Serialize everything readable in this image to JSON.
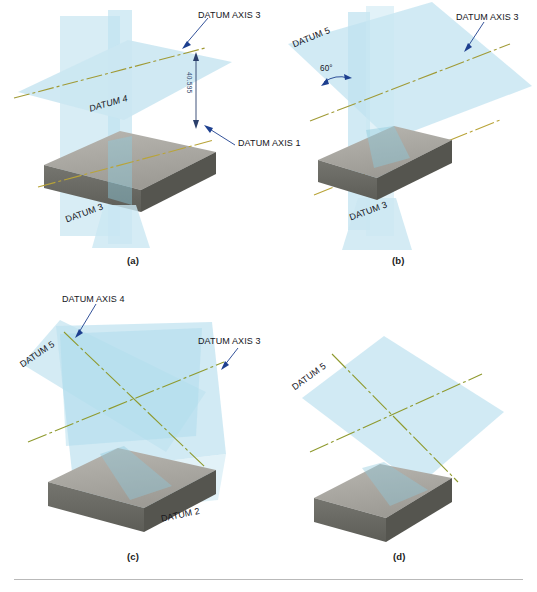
{
  "figure": {
    "panels": [
      {
        "id": "a",
        "caption": "(a)",
        "labels": [
          {
            "name": "datum-axis-3",
            "text": "DATUM AXIS 3"
          },
          {
            "name": "datum-axis-1",
            "text": "DATUM AXIS 1"
          },
          {
            "name": "datum-4",
            "text": "DATUM 4"
          },
          {
            "name": "datum-3",
            "text": "DATUM 3"
          }
        ],
        "dimension": {
          "name": "offset-dimension",
          "text": "40.595"
        },
        "planes": [
          "DATUM 3",
          "DATUM 4"
        ],
        "axes": [
          "DATUM AXIS 3",
          "DATUM AXIS 1"
        ]
      },
      {
        "id": "b",
        "caption": "(b)",
        "labels": [
          {
            "name": "datum-5",
            "text": "DATUM 5"
          },
          {
            "name": "angle",
            "text": "60°"
          },
          {
            "name": "datum-axis-3",
            "text": "DATUM AXIS 3"
          },
          {
            "name": "datum-3",
            "text": "DATUM 3"
          }
        ],
        "planes": [
          "DATUM 3",
          "DATUM 5"
        ],
        "axes": [
          "DATUM AXIS 3",
          "DATUM AXIS 1"
        ]
      },
      {
        "id": "c",
        "caption": "(c)",
        "labels": [
          {
            "name": "datum-axis-4",
            "text": "DATUM AXIS 4"
          },
          {
            "name": "datum-axis-3",
            "text": "DATUM AXIS 3"
          },
          {
            "name": "datum-5",
            "text": "DATUM 5"
          },
          {
            "name": "datum-2",
            "text": "DATUM 2"
          }
        ],
        "planes": [
          "DATUM 5",
          "DATUM 2"
        ],
        "axes": [
          "DATUM AXIS 4",
          "DATUM AXIS 3"
        ]
      },
      {
        "id": "d",
        "caption": "(d)",
        "labels": [
          {
            "name": "datum-5",
            "text": "DATUM 5"
          }
        ],
        "planes": [
          "DATUM 5"
        ],
        "axes": []
      }
    ]
  },
  "colors": {
    "plane_fill": "#cbe7f2",
    "plane_fill_light": "#ddf0f7",
    "plane_fill_deep": "#b3dcec",
    "axis_line": "#8f9a2e",
    "axis_line_warm": "#b9a438",
    "block_top": "#a9a7a1",
    "block_front": "#6b6b66",
    "block_side": "#55554f",
    "leader": "#1d3f8f",
    "text": "#15151c",
    "rule": "#b9b9b9"
  }
}
